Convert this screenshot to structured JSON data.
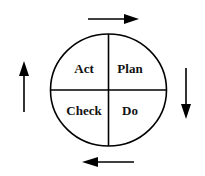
{
  "diagram": {
    "quadrants": {
      "top_left": "Act",
      "top_right": "Plan",
      "bottom_right": "Do",
      "bottom_left": "Check"
    },
    "arrows": [
      {
        "position": "top",
        "direction": "right"
      },
      {
        "position": "right",
        "direction": "down"
      },
      {
        "position": "bottom",
        "direction": "left"
      },
      {
        "position": "left",
        "direction": "up"
      }
    ],
    "colors": {
      "stroke": "#000000",
      "background": "#ffffff"
    }
  }
}
